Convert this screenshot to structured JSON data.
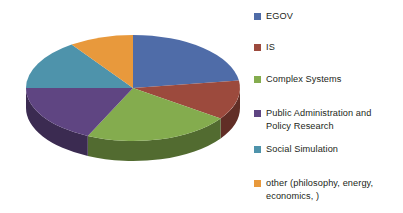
{
  "chart_data": {
    "type": "pie",
    "title": "",
    "legend_position": "right",
    "three_d": true,
    "categories": [
      "EGOV",
      "IS",
      "Complex Systems",
      "Public Administration and Policy Research",
      "Social Simulation",
      "other (philosophy, energy, economics, )"
    ],
    "values": [
      22.8,
      12.0,
      22.2,
      18.0,
      15.0,
      10.0
    ],
    "units": "percent",
    "colors": [
      "#4f6ca8",
      "#9c4a3d",
      "#84ac4e",
      "#5f4582",
      "#4e93ab",
      "#e8993c"
    ],
    "slice_start_angles_deg": [
      0,
      82,
      125,
      205,
      270,
      325
    ],
    "slice_end_angles_deg": [
      82,
      125,
      205,
      270,
      325,
      360
    ]
  },
  "legend": {
    "items": [
      {
        "label": "EGOV",
        "color": "#4f6ca8",
        "swatch_name": "legend-swatch-egov"
      },
      {
        "label": "IS",
        "color": "#9c4a3d",
        "swatch_name": "legend-swatch-is"
      },
      {
        "label": "Complex Systems",
        "color": "#84ac4e",
        "swatch_name": "legend-swatch-complex-systems"
      },
      {
        "label": "Public Administration and\nPolicy Research",
        "color": "#5f4582",
        "swatch_name": "legend-swatch-public-administration"
      },
      {
        "label": "Social Simulation",
        "color": "#4e93ab",
        "swatch_name": "legend-swatch-social-simulation"
      },
      {
        "label": "other (philosophy, energy,\neconomics, )",
        "color": "#e8993c",
        "swatch_name": "legend-swatch-other"
      }
    ]
  },
  "pie_geometry": {
    "center_x": 133,
    "center_y": 88,
    "radius_x": 107,
    "radius_y": 53,
    "depth": 20
  }
}
